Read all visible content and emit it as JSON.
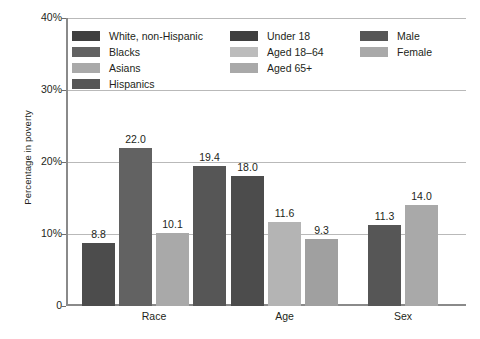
{
  "chart_data": {
    "type": "bar",
    "title": "",
    "xlabel": "",
    "ylabel": "Percentage in poverty",
    "ylim": [
      0,
      40
    ],
    "grid": true,
    "legend_position": "upper-left-inside",
    "y_ticks": [
      {
        "value": 0,
        "label": "0"
      },
      {
        "value": 10,
        "label": "10%"
      },
      {
        "value": 20,
        "label": "20%"
      },
      {
        "value": 30,
        "label": "30%"
      },
      {
        "value": 40,
        "label": "40%"
      }
    ],
    "categories": [
      "Race",
      "Age",
      "Sex"
    ],
    "groups": [
      {
        "category": "Race",
        "bars": [
          {
            "name": "White, non-Hispanic",
            "value": 8.8,
            "label": "8.8",
            "color": "#4c4c4c"
          },
          {
            "name": "Blacks",
            "value": 22.0,
            "label": "22.0",
            "color": "#626262"
          },
          {
            "name": "Asians",
            "value": 10.1,
            "label": "10.1",
            "color": "#a9a9a9"
          },
          {
            "name": "Hispanics",
            "value": 19.4,
            "label": "19.4",
            "color": "#565656"
          }
        ]
      },
      {
        "category": "Age",
        "bars": [
          {
            "name": "Under 18",
            "value": 18.0,
            "label": "18.0",
            "color": "#4c4c4c"
          },
          {
            "name": "Aged 18–64",
            "value": 11.6,
            "label": "11.6",
            "color": "#b4b4b4"
          },
          {
            "name": "Aged 65+",
            "value": 9.3,
            "label": "9.3",
            "color": "#a0a0a0"
          }
        ]
      },
      {
        "category": "Sex",
        "bars": [
          {
            "name": "Male",
            "value": 11.3,
            "label": "11.3",
            "color": "#565656"
          },
          {
            "name": "Female",
            "value": 14.0,
            "label": "14.0",
            "color": "#a9a9a9"
          }
        ]
      }
    ],
    "legend": {
      "columns": [
        {
          "items": [
            {
              "label": "White, non-Hispanic",
              "color": "#3f3f3f"
            },
            {
              "label": "Blacks",
              "color": "#626262"
            },
            {
              "label": "Asians",
              "color": "#a9a9a9"
            },
            {
              "label": "Hispanics",
              "color": "#565656"
            }
          ]
        },
        {
          "items": [
            {
              "label": "Under 18",
              "color": "#3f3f3f"
            },
            {
              "label": "Aged 18–64",
              "color": "#bcbcbc"
            },
            {
              "label": "Aged 65+",
              "color": "#a9a9a9"
            }
          ]
        },
        {
          "items": [
            {
              "label": "Male",
              "color": "#565656"
            },
            {
              "label": "Female",
              "color": "#a9a9a9"
            }
          ]
        }
      ]
    }
  }
}
